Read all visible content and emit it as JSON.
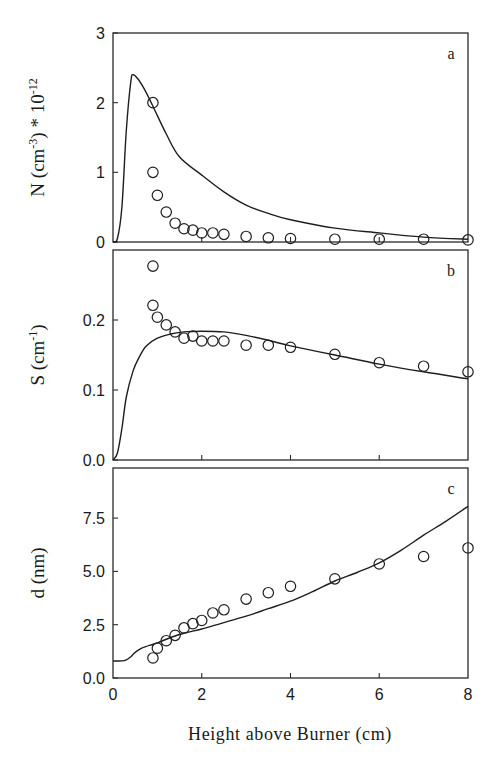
{
  "chart_data": [
    {
      "panel": "a",
      "type": "line",
      "panel_label": "a",
      "ylabel": "N (cm⁻³) * 10⁻¹²",
      "ylabel_main": "N (cm",
      "ylabel_exp": "-3",
      "ylabel_tail": ") * 10",
      "ylabel_tail_exp": "-12",
      "xlabel": "Height above Burner (cm)",
      "xlim": [
        0,
        8
      ],
      "ylim": [
        0,
        3
      ],
      "yticks": [
        0,
        1,
        2,
        3
      ],
      "ytick_labels": [
        "0",
        "1",
        "2",
        "3"
      ],
      "xticks": [
        0,
        2,
        4,
        6,
        8
      ],
      "grid": false,
      "series": [
        {
          "name": "model",
          "style": "line",
          "x": [
            0.0,
            0.1,
            0.2,
            0.3,
            0.4,
            0.45,
            0.55,
            0.7,
            0.9,
            1.2,
            1.5,
            2.0,
            2.5,
            3.0,
            3.5,
            4.0,
            5.0,
            6.0,
            7.0,
            8.0
          ],
          "y": [
            0.0,
            0.05,
            0.5,
            1.6,
            2.3,
            2.4,
            2.35,
            2.2,
            1.95,
            1.55,
            1.22,
            0.96,
            0.72,
            0.53,
            0.41,
            0.32,
            0.2,
            0.13,
            0.07,
            0.04
          ]
        },
        {
          "name": "measured",
          "style": "open-circle",
          "x": [
            0.9,
            0.9,
            1.0,
            1.2,
            1.4,
            1.6,
            1.8,
            2.0,
            2.25,
            2.5,
            3.0,
            3.5,
            4.0,
            5.0,
            6.0,
            7.0,
            8.0
          ],
          "y": [
            2.0,
            1.0,
            0.67,
            0.43,
            0.27,
            0.19,
            0.17,
            0.13,
            0.13,
            0.11,
            0.08,
            0.06,
            0.05,
            0.04,
            0.04,
            0.04,
            0.03
          ]
        }
      ]
    },
    {
      "panel": "b",
      "type": "line",
      "panel_label": "b",
      "ylabel": "S (cm⁻¹)",
      "ylabel_main": "S (cm",
      "ylabel_exp": "-1",
      "ylabel_tail": ")",
      "ylabel_tail_exp": "",
      "xlabel": "Height above Burner (cm)",
      "xlim": [
        0,
        8
      ],
      "ylim": [
        0,
        0.3
      ],
      "yticks": [
        0.0,
        0.1,
        0.2
      ],
      "ytick_labels": [
        "0.0",
        "0.1",
        "0.2"
      ],
      "xticks": [
        0,
        2,
        4,
        6,
        8
      ],
      "grid": false,
      "series": [
        {
          "name": "model",
          "style": "line",
          "x": [
            0.0,
            0.1,
            0.2,
            0.3,
            0.45,
            0.6,
            0.75,
            1.0,
            1.3,
            1.6,
            2.0,
            2.5,
            3.0,
            3.5,
            4.0,
            5.0,
            6.0,
            7.0,
            8.0
          ],
          "y": [
            0.0,
            0.01,
            0.045,
            0.09,
            0.127,
            0.148,
            0.163,
            0.174,
            0.18,
            0.183,
            0.184,
            0.183,
            0.178,
            0.171,
            0.163,
            0.15,
            0.137,
            0.126,
            0.116
          ]
        },
        {
          "name": "measured",
          "style": "open-circle",
          "x": [
            0.9,
            0.9,
            1.0,
            1.2,
            1.4,
            1.6,
            1.8,
            2.0,
            2.25,
            2.5,
            3.0,
            3.5,
            4.0,
            5.0,
            6.0,
            7.0,
            8.0
          ],
          "y": [
            0.277,
            0.221,
            0.204,
            0.193,
            0.183,
            0.174,
            0.177,
            0.17,
            0.17,
            0.17,
            0.164,
            0.164,
            0.161,
            0.151,
            0.139,
            0.134,
            0.126
          ]
        }
      ]
    },
    {
      "panel": "c",
      "type": "line",
      "panel_label": "c",
      "ylabel": "d (nm)",
      "ylabel_main": "d (nm)",
      "ylabel_exp": "",
      "ylabel_tail": "",
      "ylabel_tail_exp": "",
      "xlabel": "Height above Burner (cm)",
      "xlim": [
        0,
        8
      ],
      "ylim": [
        0,
        9.85
      ],
      "yticks": [
        0.0,
        2.5,
        5.0,
        7.5
      ],
      "ytick_labels": [
        "0.0",
        "2.5",
        "5.0",
        "7.5"
      ],
      "xticks": [
        0,
        2,
        4,
        6,
        8
      ],
      "xtick_labels": [
        "0",
        "2",
        "4",
        "6",
        "8"
      ],
      "grid": false,
      "series": [
        {
          "name": "model",
          "style": "line",
          "x": [
            0.0,
            0.2,
            0.3,
            0.4,
            0.5,
            0.65,
            0.85,
            1.0,
            1.3,
            1.6,
            2.0,
            2.5,
            3.0,
            3.5,
            4.0,
            4.5,
            5.0,
            5.5,
            6.0,
            6.5,
            7.0,
            7.5,
            8.0
          ],
          "y": [
            0.8,
            0.8,
            0.85,
            1.0,
            1.2,
            1.4,
            1.55,
            1.65,
            1.9,
            2.1,
            2.3,
            2.6,
            2.9,
            3.25,
            3.6,
            4.05,
            4.55,
            4.95,
            5.4,
            6.0,
            6.7,
            7.35,
            8.05
          ]
        },
        {
          "name": "measured",
          "style": "open-circle",
          "x": [
            0.9,
            1.0,
            1.2,
            1.4,
            1.6,
            1.8,
            2.0,
            2.25,
            2.5,
            3.0,
            3.5,
            4.0,
            5.0,
            6.0,
            7.0,
            8.0
          ],
          "y": [
            0.94,
            1.4,
            1.75,
            2.0,
            2.35,
            2.55,
            2.7,
            3.05,
            3.2,
            3.7,
            4.0,
            4.3,
            4.65,
            5.35,
            5.7,
            6.1
          ]
        }
      ]
    }
  ],
  "figure": {
    "xlabel": "Height above Burner (cm)",
    "xtick_labels": [
      "0",
      "2",
      "4",
      "6",
      "8"
    ],
    "panel_labels": [
      "a",
      "b",
      "c"
    ]
  },
  "layout": {
    "plot_left": 113,
    "plot_right": 468,
    "panels": [
      {
        "top": 33,
        "bottom": 242
      },
      {
        "top": 250,
        "bottom": 460
      },
      {
        "top": 468,
        "bottom": 678
      }
    ]
  }
}
